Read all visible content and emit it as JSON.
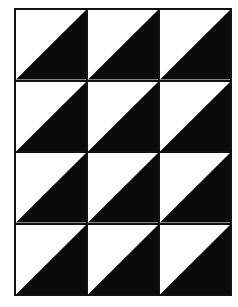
{
  "figure": {
    "rows": 4,
    "cols": 3,
    "fill_color": "#0a0a0a",
    "background_color": "#ffffff",
    "diagonal": "bottom-left to top-right",
    "filled_half": "lower-right",
    "cells": [
      {
        "row": 1,
        "col": 1
      },
      {
        "row": 1,
        "col": 2
      },
      {
        "row": 1,
        "col": 3
      },
      {
        "row": 2,
        "col": 1
      },
      {
        "row": 2,
        "col": 2
      },
      {
        "row": 2,
        "col": 3
      },
      {
        "row": 3,
        "col": 1
      },
      {
        "row": 3,
        "col": 2
      },
      {
        "row": 3,
        "col": 3
      },
      {
        "row": 4,
        "col": 1
      },
      {
        "row": 4,
        "col": 2
      },
      {
        "row": 4,
        "col": 3
      }
    ]
  },
  "caption": ""
}
